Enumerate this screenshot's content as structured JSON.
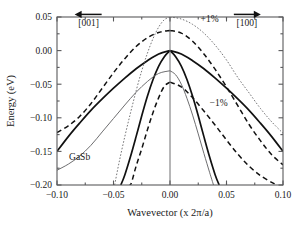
{
  "chart_data": {
    "type": "line",
    "title": "",
    "xlabel": "Wavevector (x 2π/a)",
    "ylabel": "Energy (eV)",
    "xlim": [
      -0.1,
      0.1
    ],
    "ylim": [
      -0.2,
      0.05
    ],
    "xticks": [
      -0.1,
      -0.05,
      0.0,
      0.05,
      0.1
    ],
    "xticklabels": [
      "-0.10",
      "-0.05",
      "0.00",
      "0.05",
      "0.10"
    ],
    "yticks": [
      0.05,
      0.0,
      -0.05,
      -0.1,
      -0.15,
      -0.2
    ],
    "yticklabels": [
      "0.05",
      "0.00",
      "-0.05",
      "-0.10",
      "-0.15",
      "-0.20"
    ],
    "grid": false,
    "legend": "none",
    "material": "GaSb",
    "annotations": [
      {
        "text": "[001]",
        "x": -0.072,
        "y": 0.036,
        "arrow": "left"
      },
      {
        "text": "[100]",
        "x": 0.068,
        "y": 0.036,
        "arrow": "right"
      },
      {
        "text": "+1%",
        "x": 0.035,
        "y": 0.043,
        "arrow": "none"
      },
      {
        "text": "−1%",
        "x": 0.043,
        "y": -0.083,
        "arrow": "none"
      },
      {
        "text": "GaSb",
        "x": -0.08,
        "y": -0.163,
        "arrow": "none"
      }
    ],
    "series": [
      {
        "name": "unstrained-light-hole-[001]",
        "style": "solid-thick",
        "side": "left",
        "band_edge": 0.0,
        "points": [
          [
            -0.1,
            -0.15
          ],
          [
            -0.09,
            -0.128
          ],
          [
            -0.08,
            -0.108
          ],
          [
            -0.07,
            -0.089
          ],
          [
            -0.06,
            -0.072
          ],
          [
            -0.05,
            -0.056
          ],
          [
            -0.04,
            -0.041
          ],
          [
            -0.03,
            -0.027
          ],
          [
            -0.02,
            -0.015
          ],
          [
            -0.01,
            -0.005
          ],
          [
            0.0,
            0.0
          ]
        ]
      },
      {
        "name": "unstrained-light-hole-[100]",
        "style": "solid-thick",
        "side": "right",
        "band_edge": 0.0,
        "points": [
          [
            0.0,
            0.0
          ],
          [
            0.01,
            -0.005
          ],
          [
            0.02,
            -0.015
          ],
          [
            0.03,
            -0.027
          ],
          [
            0.04,
            -0.041
          ],
          [
            0.05,
            -0.056
          ],
          [
            0.06,
            -0.072
          ],
          [
            0.07,
            -0.089
          ],
          [
            0.08,
            -0.108
          ],
          [
            0.09,
            -0.128
          ],
          [
            0.1,
            -0.15
          ]
        ]
      },
      {
        "name": "unstrained-heavy-hole-[001]",
        "style": "solid-thick",
        "side": "left",
        "band_edge": 0.0,
        "points": [
          [
            0.0,
            0.0
          ],
          [
            -0.005,
            -0.009
          ],
          [
            -0.01,
            -0.023
          ],
          [
            -0.015,
            -0.043
          ],
          [
            -0.02,
            -0.068
          ],
          [
            -0.025,
            -0.097
          ],
          [
            -0.03,
            -0.128
          ],
          [
            -0.035,
            -0.158
          ],
          [
            -0.04,
            -0.185
          ],
          [
            -0.0435,
            -0.2
          ]
        ]
      },
      {
        "name": "unstrained-heavy-hole-[100]",
        "style": "solid-thick",
        "side": "right",
        "band_edge": 0.0,
        "points": [
          [
            0.0,
            0.0
          ],
          [
            0.005,
            -0.009
          ],
          [
            0.01,
            -0.023
          ],
          [
            0.015,
            -0.043
          ],
          [
            0.02,
            -0.068
          ],
          [
            0.025,
            -0.097
          ],
          [
            0.03,
            -0.128
          ],
          [
            0.035,
            -0.158
          ],
          [
            0.04,
            -0.185
          ],
          [
            0.0435,
            -0.2
          ]
        ]
      },
      {
        "name": "compressive-minus1pct-upper-[001]",
        "style": "dashed",
        "side": "left",
        "band_edge": 0.03,
        "points": [
          [
            0.0,
            0.03
          ],
          [
            -0.01,
            0.027
          ],
          [
            -0.02,
            0.019
          ],
          [
            -0.03,
            0.006
          ],
          [
            -0.04,
            -0.012
          ],
          [
            -0.05,
            -0.033
          ],
          [
            -0.06,
            -0.056
          ],
          [
            -0.07,
            -0.079
          ],
          [
            -0.08,
            -0.098
          ],
          [
            -0.09,
            -0.112
          ],
          [
            -0.1,
            -0.122
          ]
        ]
      },
      {
        "name": "compressive-minus1pct-upper-[100]",
        "style": "dashed",
        "side": "right",
        "band_edge": 0.03,
        "points": [
          [
            0.0,
            0.03
          ],
          [
            0.01,
            0.026
          ],
          [
            0.02,
            0.014
          ],
          [
            0.03,
            -0.005
          ],
          [
            0.04,
            -0.028
          ],
          [
            0.05,
            -0.054
          ],
          [
            0.06,
            -0.082
          ],
          [
            0.07,
            -0.11
          ],
          [
            0.08,
            -0.134
          ],
          [
            0.09,
            -0.155
          ],
          [
            0.1,
            -0.17
          ]
        ]
      },
      {
        "name": "compressive-minus1pct-lower-[001]",
        "style": "dashed",
        "side": "left",
        "band_edge": -0.047,
        "points": [
          [
            0.0,
            -0.047
          ],
          [
            -0.005,
            -0.053
          ],
          [
            -0.01,
            -0.07
          ],
          [
            -0.015,
            -0.092
          ],
          [
            -0.02,
            -0.118
          ],
          [
            -0.025,
            -0.146
          ],
          [
            -0.03,
            -0.172
          ],
          [
            -0.034,
            -0.196
          ],
          [
            -0.0355,
            -0.2
          ]
        ]
      },
      {
        "name": "compressive-minus1pct-lower-[100]",
        "style": "dashed",
        "side": "right",
        "band_edge": -0.047,
        "points": [
          [
            0.0,
            -0.047
          ],
          [
            0.01,
            -0.054
          ],
          [
            0.02,
            -0.07
          ],
          [
            0.03,
            -0.09
          ],
          [
            0.04,
            -0.111
          ],
          [
            0.05,
            -0.133
          ],
          [
            0.06,
            -0.154
          ],
          [
            0.07,
            -0.172
          ],
          [
            0.08,
            -0.186
          ],
          [
            0.09,
            -0.196
          ],
          [
            0.0945,
            -0.2
          ]
        ]
      },
      {
        "name": "tensile-plus1pct-upper-[001]",
        "style": "dotted",
        "side": "left",
        "band_edge": 0.05,
        "points": [
          [
            0.0,
            0.05
          ],
          [
            -0.005,
            0.046
          ],
          [
            -0.01,
            0.035
          ],
          [
            -0.015,
            0.018
          ],
          [
            -0.02,
            -0.004
          ],
          [
            -0.025,
            -0.03
          ],
          [
            -0.03,
            -0.06
          ],
          [
            -0.035,
            -0.093
          ],
          [
            -0.04,
            -0.128
          ],
          [
            -0.045,
            -0.166
          ],
          [
            -0.049,
            -0.2
          ]
        ]
      },
      {
        "name": "tensile-plus1pct-upper-[100]",
        "style": "dotted",
        "side": "right",
        "band_edge": 0.05,
        "points": [
          [
            0.0,
            0.05
          ],
          [
            0.01,
            0.047
          ],
          [
            0.02,
            0.039
          ],
          [
            0.03,
            0.026
          ],
          [
            0.04,
            0.008
          ],
          [
            0.05,
            -0.014
          ],
          [
            0.06,
            -0.04
          ],
          [
            0.07,
            -0.063
          ],
          [
            0.08,
            -0.086
          ],
          [
            0.09,
            -0.106
          ],
          [
            0.1,
            -0.123
          ]
        ]
      },
      {
        "name": "tensile-plus1pct-lower-[001]",
        "style": "solid-thin",
        "side": "left",
        "band_edge": -0.03,
        "points": [
          [
            0.0,
            -0.03
          ],
          [
            -0.01,
            -0.034
          ],
          [
            -0.02,
            -0.046
          ],
          [
            -0.03,
            -0.062
          ],
          [
            -0.04,
            -0.081
          ],
          [
            -0.05,
            -0.101
          ],
          [
            -0.06,
            -0.121
          ],
          [
            -0.07,
            -0.141
          ],
          [
            -0.08,
            -0.157
          ],
          [
            -0.09,
            -0.169
          ],
          [
            -0.1,
            -0.178
          ]
        ]
      },
      {
        "name": "tensile-plus1pct-lower-[100]",
        "style": "solid-thin",
        "side": "right",
        "band_edge": -0.03,
        "points": [
          [
            0.0,
            -0.03
          ],
          [
            0.005,
            -0.036
          ],
          [
            0.01,
            -0.05
          ],
          [
            0.015,
            -0.071
          ],
          [
            0.02,
            -0.096
          ],
          [
            0.025,
            -0.124
          ],
          [
            0.03,
            -0.153
          ],
          [
            0.035,
            -0.181
          ],
          [
            0.0385,
            -0.2
          ]
        ]
      }
    ]
  }
}
